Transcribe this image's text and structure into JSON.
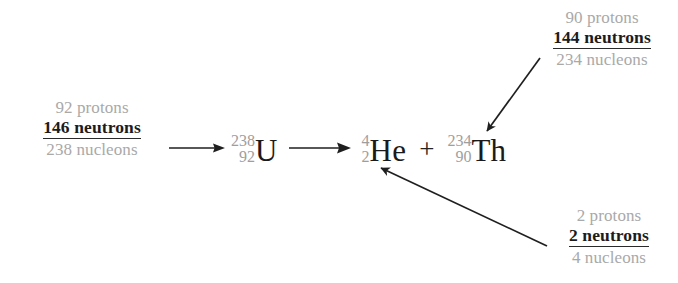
{
  "diagram": {
    "colors": {
      "background": "#ffffff",
      "muted_text": "#a9a9a9",
      "emphasis_text": "#1c1c1c",
      "arrow": "#1f1f1f",
      "superscript": "#9e9e9e"
    },
    "annotations": {
      "uranium": {
        "protons": "92 protons",
        "neutrons": "146 neutrons",
        "nucleons": "238 nucleons"
      },
      "thorium": {
        "protons": "90 protons",
        "neutrons": "144 neutrons",
        "nucleons": "234 nucleons"
      },
      "helium": {
        "protons": "2 protons",
        "neutrons": "2 neutrons",
        "nucleons": "4 nucleons"
      }
    },
    "equation": {
      "reactant": {
        "mass_number": "238",
        "atomic_number": "92",
        "symbol": "U"
      },
      "product_alpha": {
        "mass_number": "4",
        "atomic_number": "2",
        "symbol": "He"
      },
      "product_daughter": {
        "mass_number": "234",
        "atomic_number": "90",
        "symbol": "Th"
      },
      "plus": "+"
    }
  }
}
